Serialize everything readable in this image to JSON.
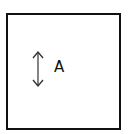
{
  "diagram": {
    "shape": "square",
    "border_color": "#111111",
    "arrow": {
      "type": "double-headed-vertical",
      "color": "#333333"
    },
    "label": "A"
  }
}
